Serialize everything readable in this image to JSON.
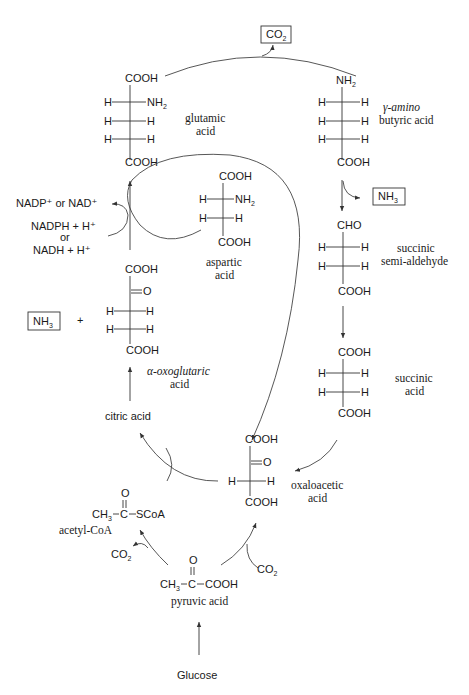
{
  "diagram": {
    "boxed_products": {
      "co2_top": {
        "label": "CO",
        "sub": "2"
      },
      "nh3_right": {
        "label": "NH",
        "sub": "3"
      },
      "nh3_left": {
        "label": "NH",
        "sub": "3"
      }
    },
    "molecules": {
      "glutamic_acid": {
        "name_line1": "glutamic",
        "name_line2": "acid",
        "top": "COOH",
        "rows": [
          {
            "left": "H",
            "right": "NH",
            "right_sub": "2"
          },
          {
            "left": "H",
            "right": "H",
            "right_sub": ""
          },
          {
            "left": "H",
            "right": "H",
            "right_sub": ""
          }
        ],
        "bottom": "COOH"
      },
      "gaba": {
        "name_line1": "γ-amino",
        "name_line2": "butyric acid",
        "top": "NH",
        "top_sub": "2",
        "rows": [
          {
            "left": "H",
            "right": "H"
          },
          {
            "left": "H",
            "right": "H"
          },
          {
            "left": "H",
            "right": "H"
          }
        ],
        "bottom": "COOH"
      },
      "aspartic_acid": {
        "name_line1": "aspartic",
        "name_line2": "acid",
        "top": "COOH",
        "rows": [
          {
            "left": "H",
            "right": "NH",
            "right_sub": "2"
          },
          {
            "left": "H",
            "right": "H",
            "right_sub": ""
          }
        ],
        "bottom": "COOH"
      },
      "succinic_semialdehyde": {
        "name_line1": "succinic",
        "name_line2": "semi-aldehyde",
        "top": "CHO",
        "rows": [
          {
            "left": "H",
            "right": "H"
          },
          {
            "left": "H",
            "right": "H"
          }
        ],
        "bottom": "COOH"
      },
      "alpha_oxoglutaric_acid": {
        "name_line1": "α-oxoglutaric",
        "name_line2": "acid",
        "top": "COOH",
        "keto": "O",
        "rows": [
          {
            "left": "H",
            "right": "H"
          },
          {
            "left": "H",
            "right": "H"
          }
        ],
        "bottom": "COOH"
      },
      "succinic_acid": {
        "name_line1": "succinic",
        "name_line2": "acid",
        "top": "COOH",
        "rows": [
          {
            "left": "H",
            "right": "H"
          },
          {
            "left": "H",
            "right": "H"
          }
        ],
        "bottom": "COOH"
      },
      "oxaloacetic_acid": {
        "name_line1": "oxaloacetic",
        "name_line2": "acid",
        "top": "COOH",
        "keto": "O",
        "rows": [
          {
            "left": "H",
            "right": "H"
          }
        ],
        "bottom": "COOH"
      },
      "acetyl_coa": {
        "name": "acetyl-CoA",
        "o": "O",
        "left": "CH",
        "left_sub": "3",
        "center": "C",
        "right": "SCoA"
      },
      "pyruvic_acid": {
        "name": "pyruvic acid",
        "o": "O",
        "left": "CH",
        "left_sub": "3",
        "center": "C",
        "right": "COOH"
      }
    },
    "cofactors": {
      "oxidized": "NADP⁺ or NAD⁺",
      "reduced_1": "NADPH + H⁺",
      "or": "or",
      "reduced_2": "NADH + H⁺"
    },
    "plus": "+",
    "citric_acid": "citric acid",
    "glucose": "Glucose",
    "co2_acetyl": {
      "label": "CO",
      "sub": "2"
    },
    "co2_oxaloacetate": {
      "label": "CO",
      "sub": "2"
    }
  }
}
